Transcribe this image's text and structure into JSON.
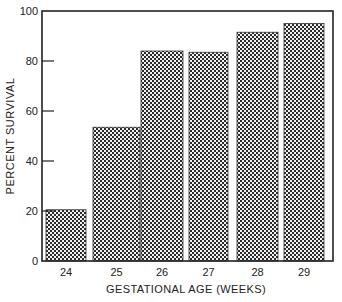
{
  "chart_data": {
    "type": "bar",
    "title": "",
    "xlabel": "GESTATIONAL AGE (WEEKS)",
    "ylabel": "PERCENT SURVIVAL",
    "categories": [
      "24",
      "25",
      "26",
      "27",
      "28",
      "29"
    ],
    "values": [
      20.5,
      53.5,
      84,
      83.5,
      91.5,
      95
    ],
    "ylim": [
      0,
      100
    ],
    "yticks": [
      0,
      20,
      40,
      60,
      80,
      100
    ],
    "grid": false,
    "legend": null,
    "bar_fill": "crosshatch",
    "colors": {
      "bar": "#333333",
      "axis": "#222222",
      "background": "#ffffff"
    }
  },
  "layout": {
    "plot": {
      "left": 42,
      "top": 11,
      "right": 333,
      "bottom": 261
    },
    "bars_x": [
      [
        46,
        86
      ],
      [
        93,
        140
      ],
      [
        141,
        183
      ],
      [
        189,
        228
      ],
      [
        237,
        278
      ],
      [
        284,
        324
      ]
    ]
  }
}
